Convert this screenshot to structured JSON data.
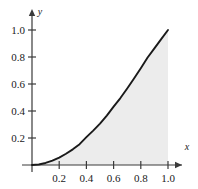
{
  "chart_data": {
    "type": "area",
    "title": "",
    "xlabel": "x",
    "ylabel": "y",
    "xlim": [
      0,
      1.08
    ],
    "ylim": [
      0,
      1.1
    ],
    "grid": false,
    "legend": "none",
    "series": [
      {
        "name": "curve",
        "description": "increasing convex curve from (0,0) to (1,1)",
        "color": "#1a1a1a",
        "x": [
          0.0,
          0.05,
          0.1,
          0.15,
          0.2,
          0.25,
          0.3,
          0.35,
          0.4,
          0.45,
          0.5,
          0.55,
          0.6,
          0.65,
          0.7,
          0.75,
          0.8,
          0.85,
          0.9,
          0.95,
          1.0
        ],
        "values": [
          0.0,
          0.004,
          0.015,
          0.032,
          0.055,
          0.083,
          0.116,
          0.154,
          0.206,
          0.255,
          0.307,
          0.366,
          0.432,
          0.496,
          0.567,
          0.641,
          0.717,
          0.796,
          0.864,
          0.932,
          1.0
        ]
      }
    ],
    "shaded_region": {
      "name": "area-under-curve",
      "from_x": 0.0,
      "to_x": 1.0,
      "fill": "#ececec"
    },
    "xticks": [
      {
        "value": 0.2,
        "label": "0.2"
      },
      {
        "value": 0.4,
        "label": "0.4"
      },
      {
        "value": 0.6,
        "label": "0.6"
      },
      {
        "value": 0.8,
        "label": "0.8"
      },
      {
        "value": 1.0,
        "label": "1.0"
      }
    ],
    "yticks": [
      {
        "value": 0.2,
        "label": "0.2"
      },
      {
        "value": 0.4,
        "label": "0.4"
      },
      {
        "value": 0.6,
        "label": "0.6"
      },
      {
        "value": 0.8,
        "label": "0.8"
      },
      {
        "value": 1.0,
        "label": "1.0"
      }
    ]
  },
  "axes": {
    "x_axis_label": "x",
    "y_axis_label": "y"
  },
  "xtick_labels": {
    "t0": "0.2",
    "t1": "0.4",
    "t2": "0.6",
    "t3": "0.8",
    "t4": "1.0"
  },
  "ytick_labels": {
    "t0": "0.2",
    "t1": "0.4",
    "t2": "0.6",
    "t3": "0.8",
    "t4": "1.0"
  },
  "colors": {
    "background": "#ffffff",
    "axis": "#3a3a3a",
    "curve": "#1a1a1a",
    "fill": "#ececec",
    "text": "#1a1a1a"
  }
}
